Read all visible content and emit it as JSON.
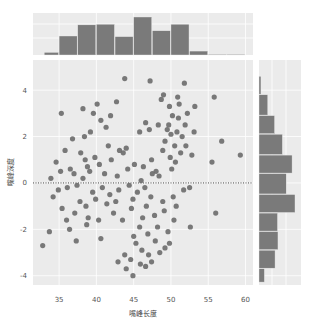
{
  "chart_data": {
    "type": "scatter",
    "subtype": "jointplot",
    "title": "",
    "xlabel": "嘴峰长度",
    "ylabel": "嘴峰深度",
    "xlim": [
      31.5,
      61
    ],
    "ylim": [
      -4.4,
      5.3
    ],
    "xticks": [
      35,
      40,
      45,
      50,
      55,
      60
    ],
    "yticks": [
      -4,
      -2,
      0,
      2,
      4
    ],
    "grid": true,
    "reference_line": {
      "axis": "y",
      "value": 0,
      "style": "dotted"
    },
    "point_color": "#6b6b6b",
    "bar_color": "#7a7a7a",
    "background_color": "#ebebeb",
    "marginal_x_histogram": {
      "bin_edges": [
        33,
        35,
        37.5,
        40,
        42.5,
        45,
        47.5,
        50,
        52.5,
        55,
        57.5,
        60
      ],
      "counts": [
        4,
        29,
        46,
        47,
        28,
        58,
        37,
        47,
        6,
        1,
        1
      ]
    },
    "marginal_y_histogram": {
      "bin_edges": [
        4.6,
        3.8,
        2.9,
        2.1,
        1.2,
        0.4,
        -0.5,
        -1.3,
        -2.1,
        -2.9,
        -3.7,
        -4.3
      ],
      "counts": [
        4,
        18,
        32,
        48,
        68,
        56,
        74,
        38,
        39,
        33,
        11
      ]
    },
    "points": [
      [
        43.8,
        4.5
      ],
      [
        47.2,
        4.4
      ],
      [
        49.8,
        3.3
      ],
      [
        51.8,
        4.3
      ],
      [
        35.3,
        3.0
      ],
      [
        48.7,
        3.6
      ],
      [
        51.1,
        3.4
      ],
      [
        53.2,
        3.3
      ],
      [
        55.8,
        3.7
      ],
      [
        38.2,
        3.2
      ],
      [
        39.6,
        3.0
      ],
      [
        40.1,
        3.4
      ],
      [
        42.7,
        3.5
      ],
      [
        40.6,
        2.7
      ],
      [
        41.3,
        2.4
      ],
      [
        47.1,
        2.3
      ],
      [
        48.3,
        2.5
      ],
      [
        49.7,
        2.5
      ],
      [
        50.2,
        2.9
      ],
      [
        51.0,
        2.8
      ],
      [
        52.2,
        3.0
      ],
      [
        49.5,
        2.3
      ],
      [
        50.0,
        2.1
      ],
      [
        50.8,
        2.2
      ],
      [
        51.5,
        2.0
      ],
      [
        49.2,
        1.8
      ],
      [
        50.5,
        1.6
      ],
      [
        48.9,
        1.4
      ],
      [
        51.3,
        1.3
      ],
      [
        52.0,
        1.6
      ],
      [
        49.9,
        1.1
      ],
      [
        50.6,
        0.9
      ],
      [
        50.1,
        0.6
      ],
      [
        45.8,
        2.2
      ],
      [
        46.6,
        2.6
      ],
      [
        44.0,
        1.5
      ],
      [
        43.6,
        1.3
      ],
      [
        56.8,
        1.8
      ],
      [
        59.3,
        1.2
      ],
      [
        55.5,
        0.9
      ],
      [
        41.6,
        1.6
      ],
      [
        43.1,
        1.4
      ],
      [
        37.9,
        1.3
      ],
      [
        38.5,
        1.0
      ],
      [
        39.8,
        1.1
      ],
      [
        42.0,
        1.0
      ],
      [
        40.4,
        0.8
      ],
      [
        38.8,
        0.7
      ],
      [
        36.5,
        0.6
      ],
      [
        35.2,
        0.5
      ],
      [
        37.0,
        0.4
      ],
      [
        39.1,
        0.5
      ],
      [
        41.1,
        0.4
      ],
      [
        42.8,
        0.3
      ],
      [
        44.2,
        0.6
      ],
      [
        45.1,
        0.8
      ],
      [
        46.3,
        0.7
      ],
      [
        47.5,
        0.4
      ],
      [
        48.4,
        0.3
      ],
      [
        34.9,
        -0.3
      ],
      [
        36.1,
        -0.2
      ],
      [
        37.4,
        -0.1
      ],
      [
        38.2,
        0.2
      ],
      [
        39.5,
        -0.4
      ],
      [
        40.8,
        -0.2
      ],
      [
        41.8,
        -0.5
      ],
      [
        43.0,
        -0.3
      ],
      [
        44.4,
        -0.1
      ],
      [
        46.0,
        0.1
      ],
      [
        37.8,
        -0.8
      ],
      [
        38.6,
        -1.0
      ],
      [
        39.9,
        -0.7
      ],
      [
        41.4,
        -0.9
      ],
      [
        42.3,
        -1.3
      ],
      [
        44.7,
        -1.1
      ],
      [
        35.4,
        -1.1
      ],
      [
        37.1,
        -1.3
      ],
      [
        38.9,
        -1.5
      ],
      [
        40.3,
        -1.6
      ],
      [
        36.4,
        -2.0
      ],
      [
        38.7,
        -1.8
      ],
      [
        40.6,
        -2.4
      ],
      [
        37.3,
        -2.5
      ],
      [
        33.7,
        -2.1
      ],
      [
        32.8,
        -2.7
      ],
      [
        48.9,
        -0.8
      ],
      [
        50.3,
        -0.6
      ],
      [
        51.7,
        -0.3
      ],
      [
        52.5,
        -0.2
      ],
      [
        46.7,
        -1.0
      ],
      [
        47.8,
        -1.4
      ],
      [
        49.1,
        -1.2
      ],
      [
        50.7,
        -1.0
      ],
      [
        48.2,
        -1.9
      ],
      [
        49.6,
        -2.1
      ],
      [
        50.4,
        -1.6
      ],
      [
        45.8,
        -1.9
      ],
      [
        46.9,
        -2.2
      ],
      [
        47.9,
        -2.5
      ],
      [
        45.3,
        -2.6
      ],
      [
        46.1,
        -2.9
      ],
      [
        47.0,
        -3.1
      ],
      [
        44.6,
        -3.3
      ],
      [
        45.9,
        -3.5
      ],
      [
        46.6,
        -3.6
      ],
      [
        44.0,
        -3.7
      ],
      [
        44.9,
        -4.0
      ],
      [
        42.9,
        -3.4
      ],
      [
        43.8,
        -3.1
      ],
      [
        48.5,
        -3.0
      ],
      [
        49.2,
        -2.8
      ],
      [
        47.4,
        -3.4
      ],
      [
        45.0,
        -2.3
      ],
      [
        52.6,
        -1.9
      ],
      [
        49.8,
        -2.6
      ],
      [
        56.0,
        -1.3
      ],
      [
        46.2,
        -1.5
      ],
      [
        47.3,
        -0.6
      ],
      [
        45.5,
        -0.4
      ],
      [
        36.8,
        1.9
      ],
      [
        38.4,
        2.0
      ],
      [
        39.2,
        2.2
      ],
      [
        35.8,
        1.4
      ],
      [
        34.6,
        0.9
      ],
      [
        33.9,
        0.2
      ],
      [
        34.2,
        -0.6
      ],
      [
        36.0,
        -1.6
      ],
      [
        42.6,
        -0.8
      ],
      [
        43.5,
        -1.6
      ],
      [
        44.9,
        -0.7
      ],
      [
        46.5,
        -0.2
      ],
      [
        48.0,
        0.5
      ],
      [
        47.4,
        1.0
      ],
      [
        51.9,
        2.5
      ],
      [
        53.1,
        2.2
      ],
      [
        52.8,
        1.2
      ],
      [
        49.0,
        3.8
      ],
      [
        50.9,
        3.7
      ],
      [
        41.9,
        2.9
      ]
    ]
  }
}
